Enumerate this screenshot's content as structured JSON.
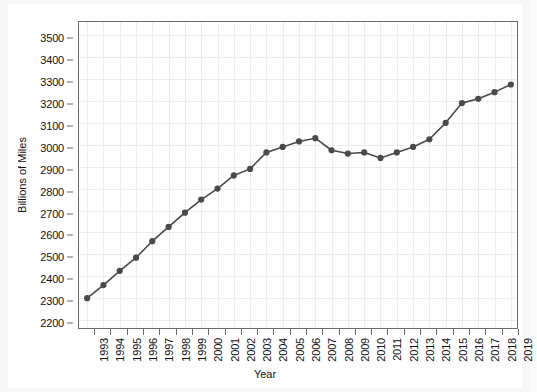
{
  "chart_data": {
    "type": "line",
    "title": "",
    "xlabel": "Year",
    "ylabel": "Billions of Miles",
    "grid": true,
    "legend": false,
    "xlim": [
      1992.4,
      2019.6
    ],
    "ylim": [
      2155,
      3560
    ],
    "yticks": [
      2200,
      2300,
      2400,
      2500,
      2600,
      2700,
      2800,
      2900,
      3000,
      3100,
      3200,
      3300,
      3400,
      3500
    ],
    "categories": [
      "1993",
      "1994",
      "1995",
      "1996",
      "1997",
      "1998",
      "1999",
      "2000",
      "2001",
      "2002",
      "2003",
      "2004",
      "2005",
      "2006",
      "2007",
      "2008",
      "2009",
      "2010",
      "2011",
      "2012",
      "2013",
      "2014",
      "2015",
      "2016",
      "2017",
      "2018",
      "2019"
    ],
    "values": [
      2300,
      2360,
      2425,
      2485,
      2560,
      2625,
      2690,
      2750,
      2800,
      2860,
      2890,
      2965,
      2990,
      3015,
      3030,
      2975,
      2960,
      2965,
      2940,
      2965,
      2990,
      3025,
      3100,
      3190,
      3210,
      3240,
      3275
    ],
    "series": [
      {
        "name": "Vehicle Miles Traveled",
        "color": "#4a4a4a",
        "marker": "circle",
        "values": [
          2300,
          2360,
          2425,
          2485,
          2560,
          2625,
          2690,
          2750,
          2800,
          2860,
          2890,
          2965,
          2990,
          3015,
          3030,
          2975,
          2960,
          2965,
          2940,
          2965,
          2990,
          3025,
          3100,
          3190,
          3210,
          3240,
          3275
        ]
      }
    ]
  },
  "style": {
    "line_color": "#4a4a4a",
    "marker_color": "#4a4a4a",
    "grid_color": "#ececec",
    "axis_color": "#6b6b6b",
    "plot_background": "#ffffff",
    "page_background": "#f7f7f7",
    "text_color": "#111111"
  }
}
